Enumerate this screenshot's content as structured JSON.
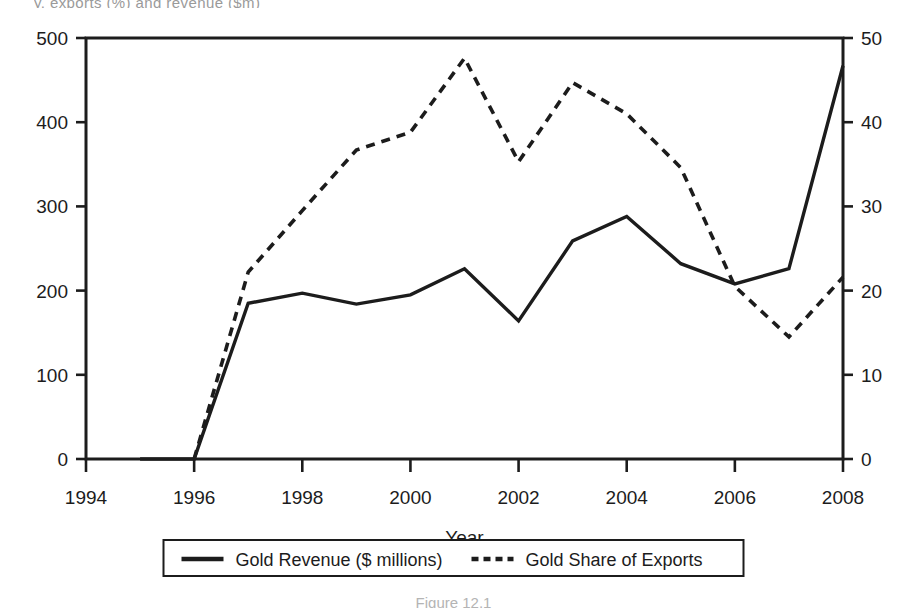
{
  "figure": {
    "top_cut_text": "y, exports (%) and revenue ($m)",
    "caption": "Figure 12.1"
  },
  "chart_data": {
    "type": "line",
    "title": "",
    "subtitle": "",
    "xlabel": "Year",
    "ylabel_left": "",
    "ylabel_right": "",
    "x": [
      1995,
      1996,
      1997,
      1998,
      1999,
      2000,
      2001,
      2002,
      2003,
      2004,
      2005,
      2006,
      2007,
      2008
    ],
    "xlim": [
      1994,
      2008
    ],
    "xticks": [
      1994,
      1996,
      1998,
      2000,
      2002,
      2004,
      2006,
      2008
    ],
    "xticklabels": [
      "1994",
      "1996",
      "1998",
      "2000",
      "2002",
      "2004",
      "2006",
      "2008"
    ],
    "ylim_left": [
      0,
      500
    ],
    "yticks_left": [
      0,
      100,
      200,
      300,
      400,
      500
    ],
    "yticklabels_left": [
      "0",
      "100",
      "200",
      "300",
      "400",
      "500"
    ],
    "ylim_right": [
      0,
      50
    ],
    "yticks_right": [
      0,
      10,
      20,
      30,
      40,
      50
    ],
    "yticklabels_right": [
      "0",
      "10",
      "20",
      "30",
      "40",
      "50"
    ],
    "grid": false,
    "legend_position": "bottom",
    "series": [
      {
        "name": "Gold Revenue ($ millions)",
        "axis": "left",
        "style": "solid",
        "color": "#1c1c1c",
        "x": [
          1995,
          1996,
          1997,
          1998,
          1999,
          2000,
          2001,
          2002,
          2003,
          2004,
          2005,
          2006,
          2007,
          2008
        ],
        "values": [
          0,
          0,
          185,
          197,
          184,
          195,
          226,
          164,
          259,
          288,
          232,
          208,
          226,
          467
        ]
      },
      {
        "name": "Gold Share of Exports",
        "axis": "right",
        "style": "dashed",
        "color": "#1c1c1c",
        "x": [
          1996,
          1997,
          1998,
          1999,
          2000,
          2001,
          2002,
          2003,
          2004,
          2005,
          2006,
          2007,
          2008
        ],
        "values": [
          0,
          22.2,
          29.5,
          36.7,
          38.8,
          47.6,
          35.3,
          44.7,
          41.0,
          34.6,
          20.5,
          14.5,
          21.6
        ]
      }
    ],
    "legend": [
      {
        "label": "Gold Revenue ($ millions)",
        "style": "solid"
      },
      {
        "label": "Gold Share of Exports",
        "style": "dashed"
      }
    ]
  }
}
